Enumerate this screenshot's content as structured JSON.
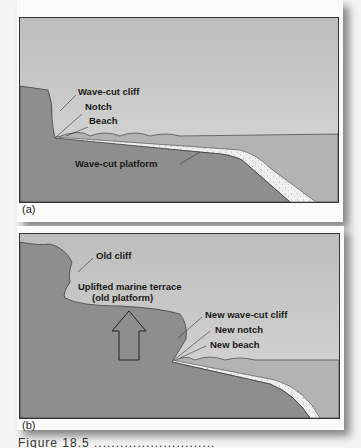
{
  "figure": {
    "panels": [
      {
        "id": "a",
        "label": "(a)",
        "annotations": {
          "wave_cut_cliff": "Wave-cut cliff",
          "notch": "Notch",
          "beach": "Beach",
          "wave_cut_platform": "Wave-cut platform"
        }
      },
      {
        "id": "b",
        "label": "(b)",
        "annotations": {
          "old_cliff": "Old cliff",
          "terrace_line1": "Uplifted marine terrace",
          "terrace_line2": "(old platform)",
          "new_wave_cut_cliff": "New wave-cut cliff",
          "new_notch": "New notch",
          "new_beach": "New beach"
        },
        "uplift_arrow": "up-arrow"
      }
    ],
    "caption": "Figure 18.5  ............................"
  },
  "colors": {
    "sky": "#c9c9c7",
    "rock": "#8c8c8a",
    "sea": "#b5b5b3",
    "sediment": "#eeeeea"
  }
}
